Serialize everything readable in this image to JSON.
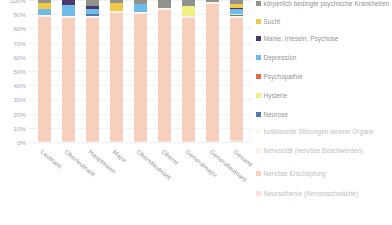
{
  "chart_data": {
    "type": "bar",
    "stacked": true,
    "normalized": "100%",
    "title": "",
    "xlabel": "",
    "ylabel": "",
    "ylim": [
      0,
      100
    ],
    "ytick_labels": [
      "100%",
      "90%",
      "80%",
      "70%",
      "60%",
      "50%",
      "40%",
      "30%",
      "20%",
      "10%",
      "0%"
    ],
    "grid": true,
    "legend_position": "right",
    "categories": [
      "Leutnant",
      "Oberleutnant",
      "Hauptmann",
      "Major",
      "Oberstleutnant",
      "Oberst",
      "Generalmajor",
      "Generalleutnant",
      "Gesamt"
    ],
    "series": [
      {
        "name": "Neurasthenie (Nervenschwäche)",
        "color": "#f7dfd5",
        "values": [
          1.0,
          1.0,
          1.0,
          1.0,
          1.0,
          1.0,
          1.0,
          1.0,
          1.0
        ]
      },
      {
        "name": "Nervöse Erschöpfung",
        "color": "#f6cdb9",
        "values": [
          87.0,
          86.0,
          85.0,
          90.0,
          89.0,
          92.0,
          86.0,
          96.0,
          87.0
        ]
      },
      {
        "name": "Nervosität (nervöse Beschwerden)",
        "color": "#fbeee6",
        "values": [
          1.0,
          1.0,
          1.0,
          1.0,
          1.0,
          1.0,
          1.0,
          1.0,
          1.0
        ]
      },
      {
        "name": "funktionelle Störungen innerer Organe",
        "color": "#fdf6ef",
        "values": [
          0.5,
          0.5,
          0.5,
          0.5,
          0.5,
          0.5,
          0.5,
          0.5,
          0.5
        ]
      },
      {
        "name": "Neurose",
        "color": "#4472a8",
        "values": [
          0.0,
          0.0,
          1.5,
          0.0,
          0.0,
          0.0,
          0.0,
          0.0,
          0.8
        ]
      },
      {
        "name": "Hysterie",
        "color": "#eef07a",
        "values": [
          0.0,
          0.0,
          0.0,
          0.0,
          0.0,
          0.0,
          7.0,
          0.0,
          0.4
        ]
      },
      {
        "name": "Psychopathie",
        "color": "#e0603a",
        "values": [
          0.0,
          0.0,
          0.0,
          0.0,
          0.0,
          0.0,
          0.0,
          0.0,
          0.3
        ]
      },
      {
        "name": "Depression",
        "color": "#62b6e8",
        "values": [
          4.5,
          8.0,
          3.5,
          0.0,
          5.5,
          0.0,
          0.0,
          0.0,
          3.5
        ]
      },
      {
        "name": "Manie, Irresein, Psychose",
        "color": "#3d2a63",
        "values": [
          0.0,
          3.5,
          1.5,
          0.0,
          0.0,
          0.0,
          0.0,
          0.0,
          0.8
        ]
      },
      {
        "name": "Sucht",
        "color": "#f2c438",
        "values": [
          4.0,
          0.0,
          0.0,
          5.5,
          0.0,
          0.0,
          0.0,
          0.0,
          3.2
        ]
      },
      {
        "name": "körperlich bedingte psychische Krankheiten",
        "color": "#8a8a84",
        "values": [
          2.0,
          0.0,
          4.5,
          2.0,
          3.0,
          5.5,
          4.0,
          1.5,
          2.5
        ]
      }
    ],
    "legend_entries": [
      {
        "label": "körperlich bedingte psychische Krankheiten",
        "color": "#8a8a84",
        "dim": false
      },
      {
        "label": "Sucht",
        "color": "#f2c438",
        "dim": false
      },
      {
        "label": "Manie, Irresein, Psychose",
        "color": "#3d2a63",
        "dim": false
      },
      {
        "label": "Depression",
        "color": "#62b6e8",
        "dim": false
      },
      {
        "label": "Psychopathie",
        "color": "#e0603a",
        "dim": false
      },
      {
        "label": "Hysterie",
        "color": "#eef07a",
        "dim": false
      },
      {
        "label": "Neurose",
        "color": "#4472a8",
        "dim": false
      },
      {
        "label": "funktionelle Störungen innerer Organe",
        "color": "#fdf6ef",
        "dim": true
      },
      {
        "label": "Nervosität (nervöse Beschwerden)",
        "color": "#fbeee6",
        "dim": true
      },
      {
        "label": "Nervöse Erschöpfung",
        "color": "#f6cdb9",
        "dim": true
      },
      {
        "label": "Neurasthenie (Nervenschwäche)",
        "color": "#f7dfd5",
        "dim": true
      }
    ]
  }
}
